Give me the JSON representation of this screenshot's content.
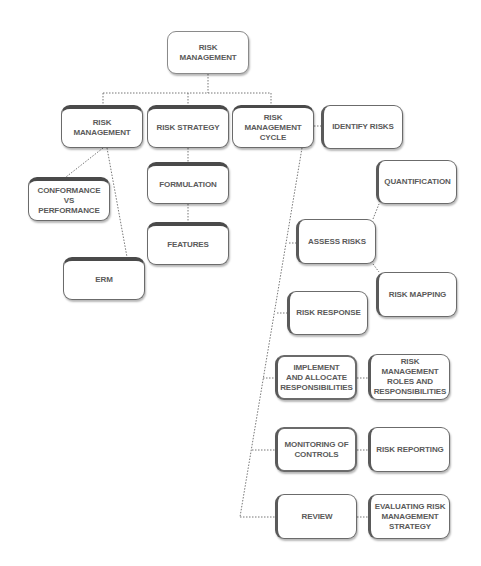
{
  "diagram": {
    "title": "Risk Management",
    "nodes": {
      "root": "RISK\nMANAGEMENT",
      "risk_management": "RISK\nMANAGEMENT",
      "risk_strategy": "RISK STRATEGY",
      "risk_management_cycle": "RISK\nMANAGEMENT\nCYCLE",
      "conformance_vs_performance": "CONFORMANCE VS\nPERFORMANCE",
      "erm": "ERM",
      "formulation": "FORMULATION",
      "features": "FEATURES",
      "identify_risks": "IDENTIFY RISKS",
      "quantification": "QUANTIFICATION",
      "assess_risks": "ASSESS RISKS",
      "risk_mapping": "RISK MAPPING",
      "risk_response": "RISK RESPONSE",
      "implement_allocate": "IMPLEMENT\nAND ALLOCATE\nRESPONSIBILITIES",
      "roles_responsibilities": "RISK MANAGEMENT\nROLES AND\nRESPONSIBILITIES",
      "monitoring_controls": "MONITORING OF\nCONTROLS",
      "risk_reporting": "RISK REPORTING",
      "review": "REVIEW",
      "evaluating_strategy": "EVALUATING RISK\nMANAGEMENT\nSTRATEGY"
    },
    "edges": [
      [
        "root",
        "risk_management"
      ],
      [
        "root",
        "risk_strategy"
      ],
      [
        "root",
        "risk_management_cycle"
      ],
      [
        "risk_management",
        "conformance_vs_performance"
      ],
      [
        "risk_management",
        "erm"
      ],
      [
        "risk_strategy",
        "formulation"
      ],
      [
        "formulation",
        "features"
      ],
      [
        "risk_management_cycle",
        "identify_risks"
      ],
      [
        "risk_management_cycle",
        "assess_risks"
      ],
      [
        "risk_management_cycle",
        "risk_response"
      ],
      [
        "risk_management_cycle",
        "implement_allocate"
      ],
      [
        "risk_management_cycle",
        "monitoring_controls"
      ],
      [
        "risk_management_cycle",
        "review"
      ],
      [
        "assess_risks",
        "quantification"
      ],
      [
        "assess_risks",
        "risk_mapping"
      ],
      [
        "implement_allocate",
        "roles_responsibilities"
      ],
      [
        "monitoring_controls",
        "risk_reporting"
      ],
      [
        "review",
        "evaluating_strategy"
      ]
    ],
    "colors": {
      "border": "#6b6b6b",
      "heavy_edge": "#4a4a4a",
      "text": "#5a5a5a",
      "connector": "#777777",
      "background": "#ffffff"
    }
  }
}
